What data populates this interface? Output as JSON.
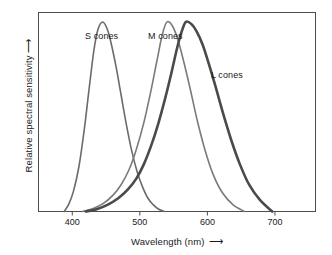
{
  "chart_data": {
    "type": "line",
    "title": "",
    "xlabel": "Wavelength (nm)",
    "ylabel": "Relative spectral sensitivity",
    "xlabel_arrow": "⟶",
    "ylabel_arrow": "↑",
    "xlim": [
      350,
      760
    ],
    "ylim": [
      0,
      1.05
    ],
    "xticks": [
      400,
      500,
      600,
      700
    ],
    "xticklabels": [
      "400",
      "500",
      "600",
      "700"
    ],
    "yticks": [],
    "yticklabels": [],
    "grid": false,
    "legend_position": "inline-annotations",
    "frame": "box",
    "series": [
      {
        "name": "S cones",
        "label": "S cones",
        "color": "#6b6b6b",
        "linewidth": 1.6,
        "peak_nm": 445,
        "x": [
          388,
          395,
          402,
          410,
          418,
          425,
          432,
          438,
          445,
          452,
          458,
          465,
          472,
          480,
          488,
          496,
          504,
          512,
          520,
          528,
          536
        ],
        "y": [
          0.0,
          0.04,
          0.11,
          0.24,
          0.44,
          0.65,
          0.85,
          0.96,
          1.0,
          0.96,
          0.88,
          0.76,
          0.62,
          0.46,
          0.32,
          0.21,
          0.13,
          0.07,
          0.035,
          0.012,
          0.0
        ]
      },
      {
        "name": "M cones",
        "label": "M cones",
        "color": "#7a7a7a",
        "linewidth": 1.6,
        "peak_nm": 540,
        "x": [
          415,
          430,
          445,
          460,
          472,
          484,
          495,
          506,
          516,
          525,
          533,
          540,
          548,
          556,
          565,
          575,
          585,
          596,
          608,
          622,
          638,
          655
        ],
        "y": [
          0.0,
          0.015,
          0.04,
          0.085,
          0.14,
          0.22,
          0.33,
          0.47,
          0.63,
          0.79,
          0.93,
          1.0,
          0.98,
          0.91,
          0.79,
          0.64,
          0.48,
          0.33,
          0.2,
          0.1,
          0.035,
          0.0
        ]
      },
      {
        "name": "L cones",
        "label": "L cones",
        "color": "#4a4a4a",
        "linewidth": 2.6,
        "peak_nm": 568,
        "x": [
          420,
          436,
          452,
          468,
          482,
          495,
          506,
          517,
          527,
          537,
          546,
          555,
          562,
          568,
          576,
          584,
          593,
          602,
          612,
          623,
          635,
          648,
          662,
          678,
          696
        ],
        "y": [
          0.0,
          0.012,
          0.035,
          0.07,
          0.115,
          0.175,
          0.25,
          0.35,
          0.46,
          0.59,
          0.72,
          0.86,
          0.95,
          1.0,
          0.99,
          0.95,
          0.88,
          0.78,
          0.66,
          0.52,
          0.38,
          0.25,
          0.14,
          0.06,
          0.0
        ]
      }
    ],
    "annotations": [
      {
        "text": "S cones",
        "x_px": 85,
        "y_px": 31
      },
      {
        "text": "M cones",
        "x_px": 148,
        "y_px": 31
      },
      {
        "text": "L cones",
        "x_px": 211,
        "y_px": 70
      }
    ]
  },
  "colors": {
    "background": "#ffffff",
    "frame": "#4d4d4d",
    "text": "#1a1a1a",
    "s_cones": "#6b6b6b",
    "m_cones": "#7a7a7a",
    "l_cones": "#4a4a4a"
  }
}
